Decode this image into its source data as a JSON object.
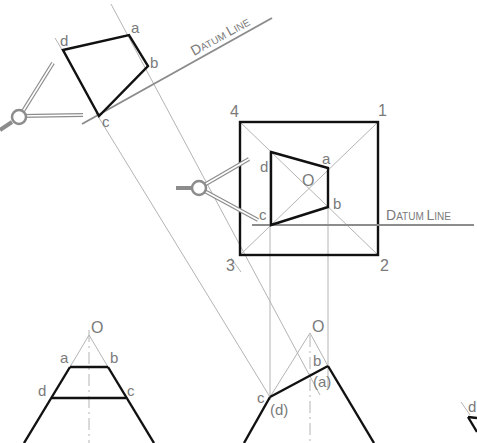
{
  "diagram": {
    "type": "descriptive-geometry-auxiliary-view",
    "colors": {
      "object_lines": "#111111",
      "construction_lines": "#b4b4b4",
      "datum_lines": "#8c8c8c",
      "labels": "#7a7a7a"
    },
    "auxiliary_view": {
      "datum_label": {
        "first": "D",
        "rest": "ATUM ",
        "first2": "L",
        "rest2": "INE"
      },
      "points": {
        "a": "a",
        "b": "b",
        "c": "c",
        "d": "d"
      }
    },
    "top_view": {
      "corners": {
        "c1": "1",
        "c2": "2",
        "c3": "3",
        "c4": "4"
      },
      "apex": "O",
      "points": {
        "a": "a",
        "b": "b",
        "c": "c",
        "d": "d"
      },
      "datum_label": {
        "first": "D",
        "rest": "ATUM ",
        "first2": "L",
        "rest2": "INE"
      }
    },
    "front_view_left": {
      "apex": "O",
      "points": {
        "a": "a",
        "b": "b",
        "c": "c",
        "d": "d"
      }
    },
    "front_view_middle": {
      "apex": "O",
      "points": {
        "b": "b",
        "a_hidden": "(a)",
        "c": "c",
        "d_hidden": "(d)"
      }
    },
    "front_view_right_partial": {
      "points": {
        "d": "d"
      }
    }
  }
}
